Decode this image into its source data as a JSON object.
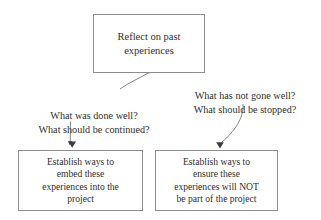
{
  "diagram": {
    "background_color": "#ffffff",
    "border_color": "#8d8d8d",
    "text_color": "#2f2f2f",
    "edge_color": "#6e6e6e",
    "nodes": {
      "reflect": {
        "label": "Reflect on past\nexperiences"
      },
      "embed": {
        "label": "Establish ways to\nembed these\nexperiences into the\nproject"
      },
      "exclude": {
        "label": "Establish ways to\nensure these\nexperiences will NOT\nbe part of the project"
      }
    },
    "edges": {
      "left": {
        "label": "What was done well?\nWhat should be continued?"
      },
      "right": {
        "label": "What has not gone well?\nWhat should be stopped?"
      }
    }
  }
}
